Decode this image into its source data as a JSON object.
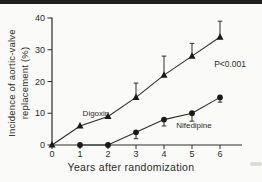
{
  "figure": {
    "top_bar_color": "#1f1f1f",
    "background": "#fafaf8"
  },
  "chart_data": {
    "type": "line",
    "title": "",
    "xlabel": "Years after randomization",
    "ylabel_line1": "Incidence of aortic-valve",
    "ylabel_line2": "replacement (%)",
    "xlim": [
      0,
      6.7
    ],
    "ylim": [
      0,
      40
    ],
    "x_ticks": [
      0,
      1,
      2,
      3,
      4,
      5,
      6
    ],
    "y_ticks": [
      0,
      10,
      20,
      30,
      40
    ],
    "grid": false,
    "legend_position": "inline-labels",
    "annotation": "P<0.001",
    "annotation_pos": {
      "x": 6.36,
      "y": 25.5
    },
    "line_color": "#2e2e2e",
    "marker_color": "#1a1a1a",
    "series": [
      {
        "name": "Digoxin",
        "marker": "triangle",
        "x": [
          0,
          1,
          2,
          3,
          4,
          5,
          6
        ],
        "values": [
          0,
          6,
          9,
          15,
          22,
          28,
          34
        ],
        "err_up": [
          0,
          0,
          0,
          4.5,
          6,
          4,
          5
        ],
        "err_down": [
          0,
          0,
          0,
          0,
          0,
          0,
          0
        ],
        "label_pos": {
          "x": 1.57,
          "y": 10.1
        }
      },
      {
        "name": "Nifedipine",
        "marker": "circle",
        "x": [
          1,
          2,
          3,
          4,
          5,
          6
        ],
        "values": [
          0,
          0,
          4,
          8,
          10,
          15
        ],
        "err_up": [
          0,
          0,
          0,
          0,
          0,
          0
        ],
        "err_down": [
          0,
          0,
          2,
          2,
          2.5,
          1.5
        ],
        "label_pos": {
          "x": 5.07,
          "y": 6.3
        }
      }
    ]
  }
}
